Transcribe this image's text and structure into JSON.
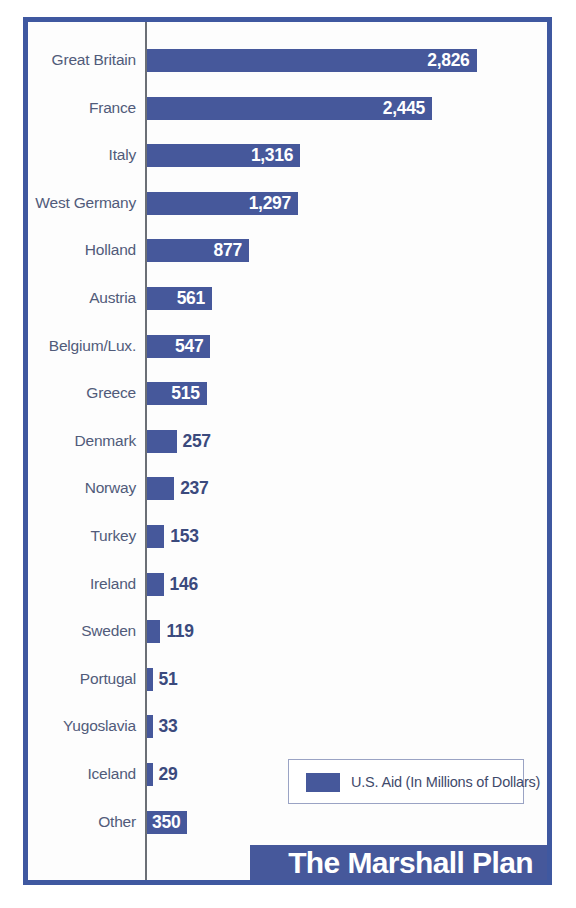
{
  "chart_data": {
    "type": "bar",
    "orientation": "horizontal",
    "title": "The Marshall Plan",
    "xlabel": "",
    "ylabel": "",
    "grid": false,
    "legend_position": "bottom-right",
    "legend": [
      "U.S. Aid (In Millions of Dollars)"
    ],
    "units": "Millions of Dollars",
    "categories": [
      "Great Britain",
      "France",
      "Italy",
      "West Germany",
      "Holland",
      "Austria",
      "Belgium/Lux.",
      "Greece",
      "Denmark",
      "Norway",
      "Turkey",
      "Ireland",
      "Sweden",
      "Portugal",
      "Yugoslavia",
      "Iceland",
      "Other"
    ],
    "values": [
      2826,
      2445,
      1316,
      1297,
      877,
      561,
      547,
      515,
      257,
      237,
      153,
      146,
      119,
      51,
      33,
      29,
      350
    ],
    "value_labels": [
      "2,826",
      "2,445",
      "1,316",
      "1,297",
      "877",
      "561",
      "547",
      "515",
      "257",
      "237",
      "153",
      "146",
      "119",
      "51",
      "33",
      "29",
      "350"
    ],
    "label_placement": [
      "inside",
      "inside",
      "inside",
      "inside",
      "inside",
      "inside",
      "inside",
      "inside",
      "outside",
      "outside",
      "outside",
      "outside",
      "outside",
      "outside",
      "outside",
      "outside",
      "inside"
    ],
    "xlim": [
      0,
      2826
    ],
    "series": [
      {
        "name": "U.S. Aid (In Millions of Dollars)",
        "values": [
          2826,
          2445,
          1316,
          1297,
          877,
          561,
          547,
          515,
          257,
          237,
          153,
          146,
          119,
          51,
          33,
          29,
          350
        ]
      }
    ]
  },
  "rows": [
    {
      "label": "Great Britain",
      "value": 2826,
      "value_label": "2,826",
      "placement": "inside"
    },
    {
      "label": "France",
      "value": 2445,
      "value_label": "2,445",
      "placement": "inside"
    },
    {
      "label": "Italy",
      "value": 1316,
      "value_label": "1,316",
      "placement": "inside"
    },
    {
      "label": "West Germany",
      "value": 1297,
      "value_label": "1,297",
      "placement": "inside"
    },
    {
      "label": "Holland",
      "value": 877,
      "value_label": "877",
      "placement": "inside"
    },
    {
      "label": "Austria",
      "value": 561,
      "value_label": "561",
      "placement": "inside"
    },
    {
      "label": "Belgium/Lux.",
      "value": 547,
      "value_label": "547",
      "placement": "inside"
    },
    {
      "label": "Greece",
      "value": 515,
      "value_label": "515",
      "placement": "inside"
    },
    {
      "label": "Denmark",
      "value": 257,
      "value_label": "257",
      "placement": "outside"
    },
    {
      "label": "Norway",
      "value": 237,
      "value_label": "237",
      "placement": "outside"
    },
    {
      "label": "Turkey",
      "value": 153,
      "value_label": "153",
      "placement": "outside"
    },
    {
      "label": "Ireland",
      "value": 146,
      "value_label": "146",
      "placement": "outside"
    },
    {
      "label": "Sweden",
      "value": 119,
      "value_label": "119",
      "placement": "outside"
    },
    {
      "label": "Portugal",
      "value": 51,
      "value_label": "51",
      "placement": "outside"
    },
    {
      "label": "Yugoslavia",
      "value": 33,
      "value_label": "33",
      "placement": "outside"
    },
    {
      "label": "Iceland",
      "value": 29,
      "value_label": "29",
      "placement": "outside"
    },
    {
      "label": "Other",
      "value": 350,
      "value_label": "350",
      "placement": "inside"
    }
  ],
  "legend": {
    "label": "U.S. Aid (In Millions of Dollars)",
    "swatch_name": "legend-color-swatch"
  },
  "title": {
    "text": "The Marshall Plan"
  },
  "colors": {
    "bar": "#46589b",
    "frame": "#3f58a0",
    "label_text": "#515b7a",
    "value_outside_text": "#3b4a7d",
    "value_inside_text": "#ffffff",
    "axis_line": "#6b6f76",
    "legend_border": "#9aa3c4",
    "title_band": "#46589b",
    "title_text": "#ffffff",
    "background": "#ffffff"
  }
}
